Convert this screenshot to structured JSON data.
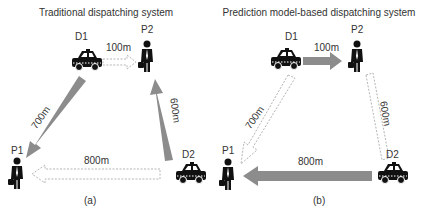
{
  "panels": [
    {
      "title": "Traditional dispatching system",
      "caption": "(a)",
      "nodes": {
        "d1": "D1",
        "d2": "D2",
        "p1": "P1",
        "p2": "P2"
      },
      "edges": {
        "d1_p2": {
          "label": "100m",
          "style": "dashed"
        },
        "d1_p1": {
          "label": "700m",
          "style": "solid"
        },
        "d2_p2": {
          "label": "600m",
          "style": "solid"
        },
        "d2_p1": {
          "label": "800m",
          "style": "dashed"
        }
      }
    },
    {
      "title": "Prediction model-based dispatching system",
      "caption": "(b)",
      "nodes": {
        "d1": "D1",
        "d2": "D2",
        "p1": "P1",
        "p2": "P2"
      },
      "edges": {
        "d1_p2": {
          "label": "100m",
          "style": "solid"
        },
        "d1_p1": {
          "label": "700m",
          "style": "dashed"
        },
        "d2_p2": {
          "label": "600m",
          "style": "dashed"
        },
        "d2_p1": {
          "label": "800m",
          "style": "solid"
        }
      }
    }
  ],
  "colors": {
    "solid_arrow": "#8c8c8c",
    "dashed_arrow": "#b5b5b5",
    "icon": "#111111"
  }
}
